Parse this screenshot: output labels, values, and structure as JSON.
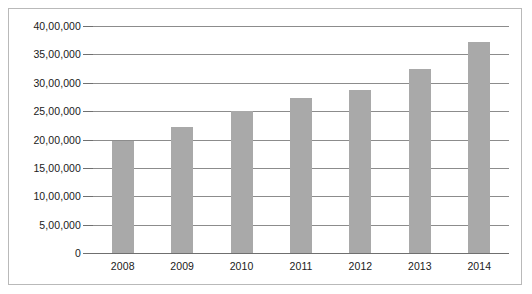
{
  "chart_data": {
    "type": "bar",
    "title": "",
    "subtitle": "",
    "xlabel": "",
    "ylabel": "",
    "categories": [
      "2008",
      "2009",
      "2010",
      "2011",
      "2012",
      "2013",
      "2014"
    ],
    "values": [
      1975000,
      2225000,
      2500000,
      2725000,
      2875000,
      3250000,
      3725000
    ],
    "series": [
      {
        "name": "",
        "values": [
          1975000,
          2225000,
          2500000,
          2725000,
          2875000,
          3250000,
          3725000
        ]
      }
    ],
    "ylim": [
      0,
      4000000
    ],
    "ytick_values": [
      0,
      500000,
      1000000,
      1500000,
      2000000,
      2500000,
      3000000,
      3500000,
      4000000
    ],
    "ytick_labels": [
      "0",
      "5,00,000",
      "10,00,000",
      "15,00,000",
      "20,00,000",
      "25,00,000",
      "30,00,000",
      "35,00,000",
      "40,00,000"
    ],
    "grid": true,
    "grid_axis": "y",
    "legend": false,
    "legend_position": "none",
    "annotations": [],
    "colors": {
      "bar_fill": "#a9a9a9",
      "gridline": "#8c8c8c",
      "axis": "#6f6f6f",
      "border": "#b9b9b9",
      "text": "#1a1a1a",
      "background": "#ffffff"
    }
  }
}
